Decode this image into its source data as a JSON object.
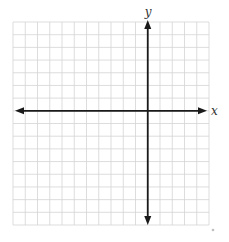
{
  "diagram": {
    "type": "coordinate-plane",
    "grid": {
      "columns": 16,
      "rows": 16,
      "left": 13,
      "top": 22,
      "right": 209,
      "bottom": 225,
      "line_color": "#d4d4d4"
    },
    "axes": {
      "color": "#1a1a1a",
      "x_axis_row": 7,
      "y_axis_column": 11,
      "x_label": "x",
      "y_label": "y",
      "x_arrow_left": 15,
      "x_arrow_right": 207,
      "y_arrow_top": 20,
      "y_arrow_bottom": 225
    },
    "speck": {
      "x": 213,
      "y": 230,
      "color": "#bfbfbf"
    }
  }
}
